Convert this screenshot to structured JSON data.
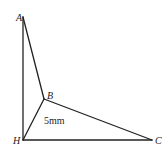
{
  "diagram": {
    "type": "geometry-figure",
    "points": {
      "A": {
        "label": "A",
        "x": 23,
        "y": 17
      },
      "B": {
        "label": "B",
        "x": 44,
        "y": 99
      },
      "H": {
        "label": "H",
        "x": 23,
        "y": 140
      },
      "C": {
        "label": "C",
        "x": 152,
        "y": 140
      }
    },
    "segments": [
      {
        "from": "A",
        "to": "H"
      },
      {
        "from": "A",
        "to": "B"
      },
      {
        "from": "B",
        "to": "H"
      },
      {
        "from": "B",
        "to": "C"
      },
      {
        "from": "H",
        "to": "C"
      }
    ],
    "measurement": {
      "text": "5mm"
    },
    "colors": {
      "line": "#222222",
      "background": "#ffffff"
    }
  }
}
